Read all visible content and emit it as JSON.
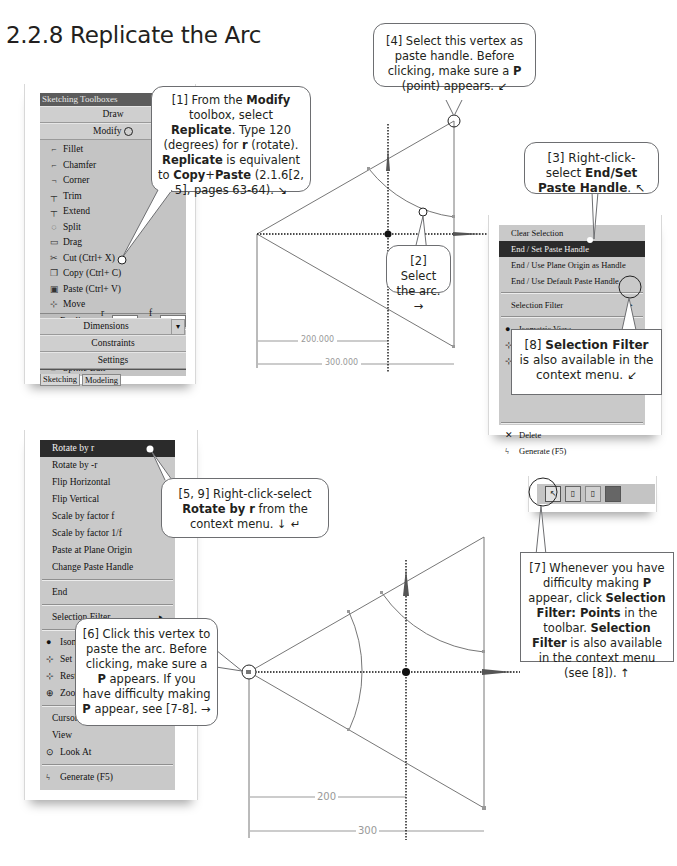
{
  "section": {
    "number": "2.2.8",
    "title": "2.2.8 Replicate the Arc"
  },
  "sketching_toolboxes": {
    "title": "Sketching Toolboxes",
    "groups_top": [
      "Draw",
      "Modify"
    ],
    "modify_items": [
      {
        "icon": "fillet-icon",
        "label": "Fillet"
      },
      {
        "icon": "chamfer-icon",
        "label": "Chamfer"
      },
      {
        "icon": "corner-icon",
        "label": "Corner"
      },
      {
        "icon": "trim-icon",
        "label": "Trim"
      },
      {
        "icon": "extend-icon",
        "label": "Extend"
      },
      {
        "icon": "split-icon",
        "label": "Split"
      },
      {
        "icon": "drag-icon",
        "label": "Drag"
      },
      {
        "icon": "cut-icon",
        "label": "Cut (Ctrl+ X)"
      },
      {
        "icon": "copy-icon",
        "label": "Copy (Ctrl+ C)"
      },
      {
        "icon": "paste-icon",
        "label": "Paste (Ctrl+ V)"
      },
      {
        "icon": "move-icon",
        "label": "Move"
      }
    ],
    "replicate": {
      "label": "Replicate",
      "r_label": "r =",
      "r_value": "120 °",
      "f_label": "f =",
      "f_value": "2"
    },
    "modify_items_after": [
      {
        "icon": "duplicate-icon",
        "label": "Duplicate"
      },
      {
        "icon": "offset-icon",
        "label": "Offset"
      },
      {
        "icon": "spline-edit-icon",
        "label": "Spline Edit"
      }
    ],
    "groups_bottom": [
      "Dimensions",
      "Constraints",
      "Settings"
    ],
    "tabs": [
      "Sketching",
      "Modeling"
    ]
  },
  "context_menu_paste_handle": {
    "items": [
      "Clear Selection",
      "End / Set Paste Handle",
      "End / Use Plane Origin as Handle",
      "End / Use Default Paste Handle"
    ],
    "selected": "End / Set Paste Handle",
    "selection_filter": "Selection Filter",
    "view_items": [
      {
        "icon": "isometric-view-icon",
        "label": "Isometric View"
      },
      {
        "icon": "set-icon",
        "label": "Set"
      },
      {
        "icon": "restore-default-icon",
        "label": "Restore Default"
      }
    ],
    "bottom_items": [
      {
        "icon": "delete-icon",
        "label": "Delete"
      },
      {
        "icon": "generate-icon",
        "label": "Generate (F5)"
      }
    ]
  },
  "context_menu_paste": {
    "items": [
      "Rotate by r",
      "Rotate by -r",
      "Flip Horizontal",
      "Flip Vertical",
      "Scale by factor f",
      "Scale by factor 1/f",
      "Paste at Plane Origin",
      "Change Paste Handle"
    ],
    "selected": "Rotate by r",
    "end": "End",
    "selection_filter": "Selection Filter",
    "view_items": [
      {
        "icon": "isometric-view-icon",
        "label": "Isometric View"
      },
      {
        "icon": "set-icon",
        "label": "Set"
      },
      {
        "icon": "restore-icon",
        "label": "Restore Default"
      },
      {
        "icon": "zoom-icon",
        "label": "Zoom to Fit"
      }
    ],
    "cursor_items": [
      "Cursor Mode",
      "View"
    ],
    "look_at": "Look At",
    "generate": "Generate (F5)"
  },
  "sketch_top": {
    "dimensions": [
      {
        "label": "200.000"
      },
      {
        "label": "300.000"
      }
    ]
  },
  "sketch_bottom": {
    "dimensions": [
      {
        "label": "200"
      },
      {
        "label": "300"
      }
    ]
  },
  "toolbar_selection_filter": {
    "buttons": [
      "select-points-icon",
      "select-edges-icon",
      "select-faces-icon",
      "select-bodies-icon"
    ]
  },
  "callouts": {
    "c1": {
      "prefix": "[1] From the ",
      "b1": "Modify",
      "t1": " toolbox, select ",
      "b2": "Replicate",
      "t2": ". Type 120 (degrees) for ",
      "b3": "r",
      "t3": " (rotate). ",
      "b4": "Replicate",
      "t4": " is equivalent to ",
      "b5": "Copy",
      "t5": "+",
      "b6": "Paste",
      "t6": " (2.1.6[2, 5], pages 63-64). ↘"
    },
    "c2": {
      "text": "[2] Select the arc. →"
    },
    "c3": {
      "prefix": "[3] Right-click-select ",
      "bold": "End/Set Paste Handle",
      "suffix": ". ↖"
    },
    "c4": {
      "prefix": "[4] Select this vertex as paste handle. Before clicking, make sure a ",
      "bold": "P",
      "suffix": " (point) appears. ↙"
    },
    "c5": {
      "prefix": "[5, 9] Right-click-select ",
      "bold": "Rotate by r",
      "suffix": " from the context menu. ↓ ↵"
    },
    "c6": {
      "prefix": "[6] Click this vertex to paste the arc. Before clicking, make sure a ",
      "b1": "P",
      "t1": " appears. If you have difficulty making ",
      "b2": "P",
      "t2": " appear, see [7-8]. →"
    },
    "c7": {
      "prefix": "[7] Whenever you have difficulty making ",
      "b1": "P",
      "t1": " appear, click ",
      "b2": "Selection Filter: Points",
      "t2": " in the toolbar. ",
      "b3": "Selection Filter",
      "t3": " is also available in the context menu (see [8]). ↑"
    },
    "c8": {
      "prefix": "[8] ",
      "bold": "Selection Filter",
      "suffix": " is also available in the context menu. ↙"
    }
  }
}
